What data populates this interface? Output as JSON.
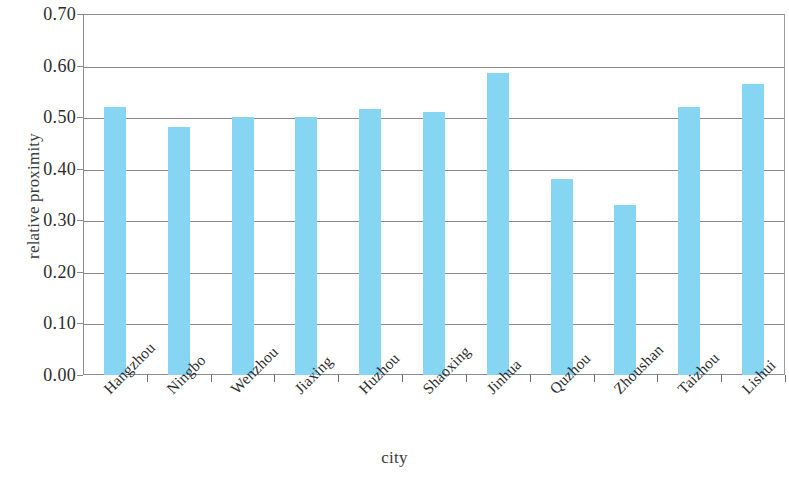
{
  "chart_data": {
    "type": "bar",
    "title": "",
    "xlabel": "city",
    "ylabel": "relative proximity",
    "categories": [
      "Hangzhou",
      "Ningbo",
      "Wenzhou",
      "Jiaxing",
      "Huzhou",
      "Shaoxing",
      "Jinhua",
      "Quzhou",
      "Zhoushan",
      "Taizhou",
      "Lishui"
    ],
    "values": [
      0.52,
      0.48,
      0.5,
      0.5,
      0.515,
      0.51,
      0.585,
      0.38,
      0.33,
      0.52,
      0.565
    ],
    "ylim": [
      0.0,
      0.7
    ],
    "ytick_step": 0.1,
    "ytick_labels": [
      "0.00",
      "0.10",
      "0.20",
      "0.30",
      "0.40",
      "0.50",
      "0.60",
      "0.70"
    ],
    "ytick_values": [
      0.0,
      0.1,
      0.2,
      0.3,
      0.4,
      0.5,
      0.6,
      0.7
    ],
    "grid": true,
    "grid_axis": "y",
    "legend": false,
    "legend_position": "none",
    "bar_color": "#86d5f2",
    "axis_color": "#8a8a8a",
    "background_color": "#ffffff",
    "xtick_label_rotation": -45
  }
}
